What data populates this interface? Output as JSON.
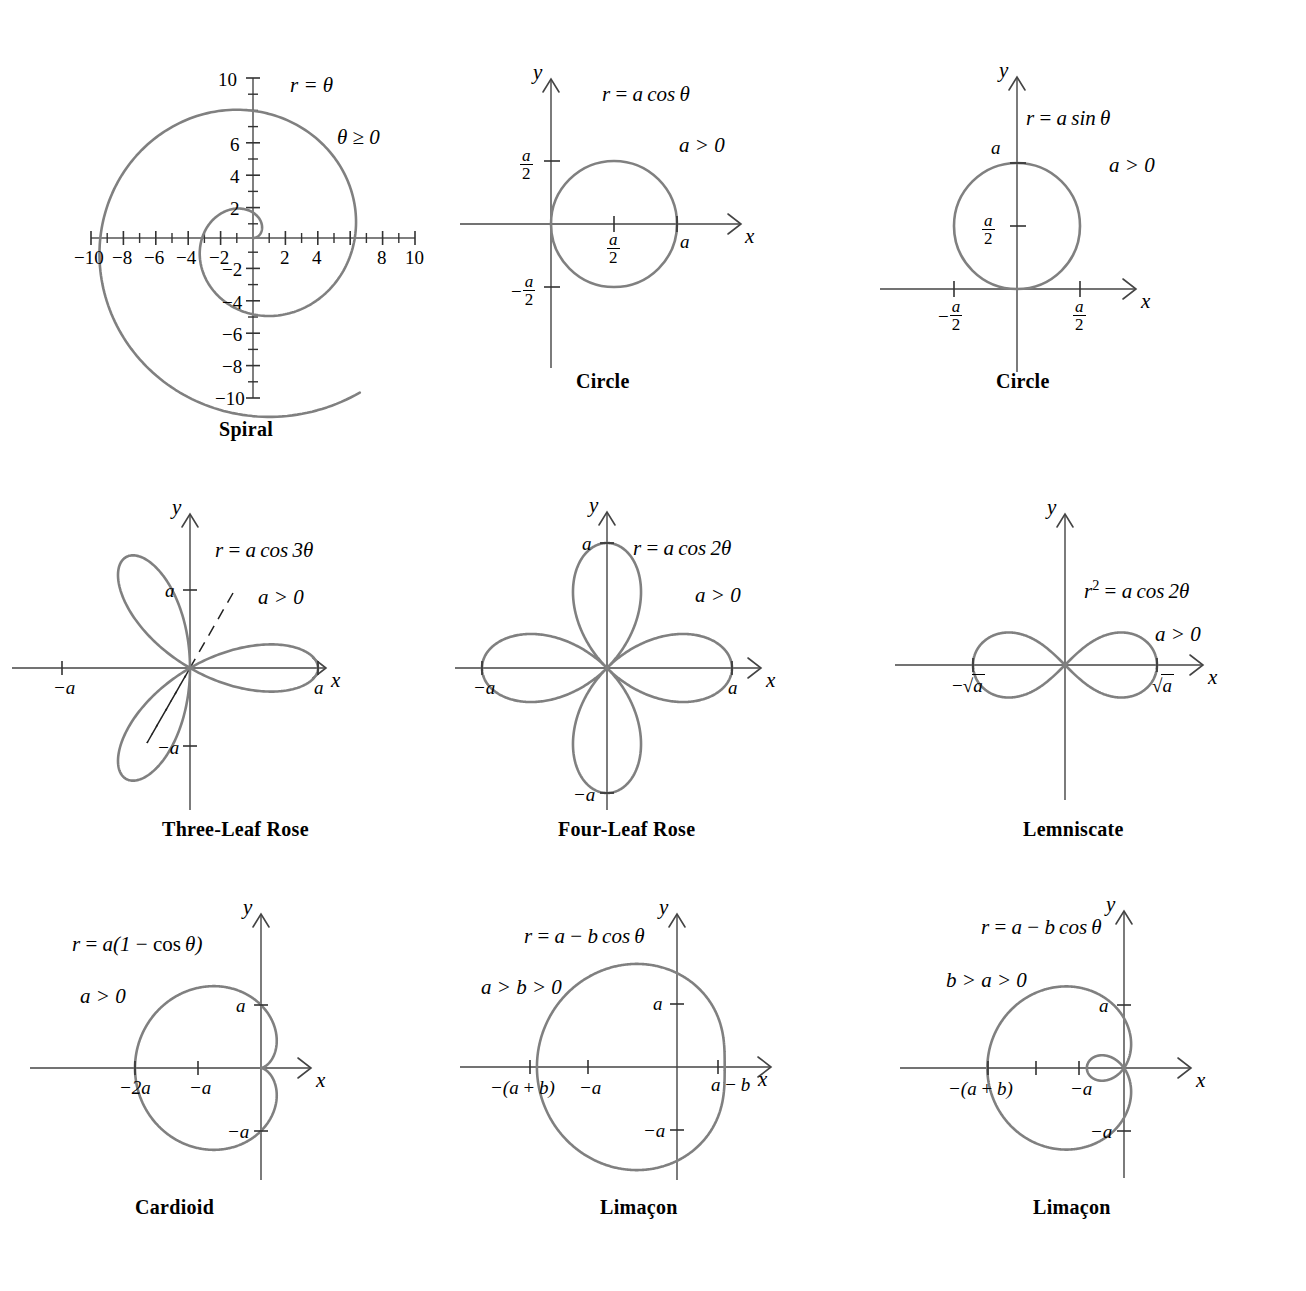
{
  "figure": {
    "kind": "polar-curve-reference-sheet",
    "curve_color": "#808080",
    "axis_color": "#555555",
    "text_color": "#000000",
    "background": "#ffffff"
  },
  "panels": [
    {
      "id": "spiral",
      "caption": "Spiral",
      "equation": "r = θ",
      "condition": "θ ≥ 0",
      "axis_x_label": "",
      "axis_y_label": "",
      "x_tick_labels": [
        "−10",
        "−8",
        "−6",
        "−4",
        "−2",
        "2",
        "4",
        "6",
        "8",
        "10"
      ],
      "y_tick_labels": [
        "10",
        "6",
        "4",
        "2",
        "−2",
        "−4",
        "−6",
        "−8",
        "−10"
      ],
      "axis_range_x": [
        -10,
        10
      ],
      "axis_range_y": [
        -10,
        10
      ],
      "tick_step": 1,
      "labeled_tick_step": 2
    },
    {
      "id": "circle-cos",
      "caption": "Circle",
      "equation": "r = a cos θ",
      "condition": "a > 0",
      "axis_x_label": "x",
      "axis_y_label": "y",
      "marks": [
        "a/2 (top)",
        "−a/2 (bottom)",
        "a/2 (center on x)",
        "a (right)"
      ]
    },
    {
      "id": "circle-sin",
      "caption": "Circle",
      "equation": "r = a sin θ",
      "condition": "a > 0",
      "axis_x_label": "x",
      "axis_y_label": "y",
      "marks": [
        "a (top)",
        "a/2 (on y)",
        "−a/2 (left on x)",
        "a/2 (right on x)"
      ]
    },
    {
      "id": "three-leaf-rose",
      "caption": "Three-Leaf Rose",
      "equation": "r = a cos 3θ",
      "condition": "a > 0",
      "axis_x_label": "x",
      "axis_y_label": "y",
      "marks": [
        "a (on y)",
        "−a (on y)",
        "−a (on x)",
        "a (on x)"
      ],
      "petal_axes_deg": [
        0,
        120,
        240
      ],
      "dashed_guides": true
    },
    {
      "id": "four-leaf-rose",
      "caption": "Four-Leaf Rose",
      "equation": "r = a cos 2θ",
      "condition": "a > 0",
      "axis_x_label": "x",
      "axis_y_label": "y",
      "marks": [
        "a (on y)",
        "−a (on y)",
        "−a (on x)",
        "a (on x)"
      ],
      "petal_axes_deg": [
        0,
        90,
        180,
        270
      ]
    },
    {
      "id": "lemniscate",
      "caption": "Lemniscate",
      "equation": "r² = a cos 2θ",
      "condition": "a > 0",
      "axis_x_label": "x",
      "axis_y_label": "y",
      "marks": [
        "−√a (left on x)",
        "√a (right on x)"
      ]
    },
    {
      "id": "cardioid",
      "caption": "Cardioid",
      "equation": "r = a(1 − cos θ)",
      "condition": "a > 0",
      "axis_x_label": "x",
      "axis_y_label": "y",
      "marks": [
        "a (on y)",
        "−a (on y)",
        "−2a (on x)",
        "−a (on x)"
      ]
    },
    {
      "id": "limacon-a-gt-b",
      "caption": "Limaçon",
      "equation": "r = a − b cos θ",
      "condition": "a > b > 0",
      "axis_x_label": "x",
      "axis_y_label": "y",
      "marks": [
        "a (on y)",
        "−a (on y)",
        "−(a + b) (on x)",
        "−a (on x)",
        "a − b (on x)"
      ]
    },
    {
      "id": "limacon-b-gt-a",
      "caption": "Limaçon",
      "equation": "r = a − b cos θ",
      "condition": "b > a > 0",
      "axis_x_label": "x",
      "axis_y_label": "y",
      "marks": [
        "a (on y)",
        "−a (on y)",
        "−(a + b) (on x)",
        "−a (on x)"
      ],
      "inner_loop": true
    }
  ],
  "chart_data": [
    {
      "type": "line",
      "id": "spiral",
      "title": "Spiral",
      "polar_equation": "r = theta",
      "domain_theta": [
        0,
        10
      ],
      "xlabel": "",
      "ylabel": "",
      "xlim": [
        -10,
        10
      ],
      "ylim": [
        -10,
        10
      ],
      "xticks": [
        -10,
        -9,
        -8,
        -7,
        -6,
        -5,
        -4,
        -3,
        -2,
        -1,
        1,
        2,
        3,
        4,
        5,
        6,
        7,
        8,
        9,
        10
      ],
      "xticklabels": [
        "-10",
        "",
        "-8",
        "",
        "-6",
        "",
        "-4",
        "",
        "-2",
        "",
        "",
        "2",
        "",
        "4",
        "",
        "",
        "",
        "8",
        "",
        "10"
      ],
      "yticks": [
        -10,
        -9,
        -8,
        -7,
        -6,
        -5,
        -4,
        -3,
        -2,
        -1,
        1,
        2,
        3,
        4,
        5,
        6,
        7,
        8,
        9,
        10
      ],
      "yticklabels": [
        "-10",
        "",
        "-8",
        "",
        "-6",
        "",
        "-4",
        "",
        "-2",
        "",
        "",
        "2",
        "",
        "4",
        "",
        "6",
        "",
        "",
        "",
        "10"
      ],
      "grid": false,
      "annotations": [
        "r = θ",
        "θ ≥ 0"
      ]
    },
    {
      "type": "line",
      "id": "circle-cos",
      "title": "Circle",
      "polar_equation": "r = a*cos(theta)",
      "annotations": [
        "r = a cos θ",
        "a > 0"
      ],
      "axis_intercepts": {
        "x": [
          "0",
          "a"
        ],
        "y": [
          "a/2",
          "-a/2"
        ]
      },
      "center": "a/2 on x-axis",
      "radius": "a/2",
      "xlabel": "x",
      "ylabel": "y",
      "grid": false
    },
    {
      "type": "line",
      "id": "circle-sin",
      "title": "Circle",
      "polar_equation": "r = a*sin(theta)",
      "annotations": [
        "r = a sin θ",
        "a > 0"
      ],
      "axis_intercepts": {
        "y": [
          "0",
          "a"
        ],
        "x": [
          "-a/2",
          "a/2"
        ]
      },
      "center": "a/2 on y-axis",
      "radius": "a/2",
      "xlabel": "x",
      "ylabel": "y",
      "grid": false
    },
    {
      "type": "line",
      "id": "three-leaf-rose",
      "title": "Three-Leaf Rose",
      "polar_equation": "r = a*cos(3*theta)",
      "annotations": [
        "r = a cos 3θ",
        "a > 0"
      ],
      "petal_tips_deg": [
        0,
        120,
        240
      ],
      "petal_length": "a",
      "xticklabels": [
        "-a",
        "a"
      ],
      "yticklabels": [
        "a",
        "-a"
      ],
      "xlabel": "x",
      "ylabel": "y",
      "grid": false
    },
    {
      "type": "line",
      "id": "four-leaf-rose",
      "title": "Four-Leaf Rose",
      "polar_equation": "r = a*cos(2*theta)",
      "annotations": [
        "r = a cos 2θ",
        "a > 0"
      ],
      "petal_tips_deg": [
        0,
        90,
        180,
        270
      ],
      "petal_length": "a",
      "xticklabels": [
        "-a",
        "a"
      ],
      "yticklabels": [
        "a",
        "-a"
      ],
      "xlabel": "x",
      "ylabel": "y",
      "grid": false
    },
    {
      "type": "line",
      "id": "lemniscate",
      "title": "Lemniscate",
      "polar_equation": "r^2 = a*cos(2*theta)",
      "annotations": [
        "r² = a cos 2θ",
        "a > 0"
      ],
      "xticklabels": [
        "-√a",
        "√a"
      ],
      "xlabel": "x",
      "ylabel": "y",
      "grid": false
    },
    {
      "type": "line",
      "id": "cardioid",
      "title": "Cardioid",
      "polar_equation": "r = a*(1 - cos(theta))",
      "annotations": [
        "r = a(1 − cos θ)",
        "a > 0"
      ],
      "xticklabels": [
        "-2a",
        "-a"
      ],
      "yticklabels": [
        "a",
        "-a"
      ],
      "xlabel": "x",
      "ylabel": "y",
      "grid": false
    },
    {
      "type": "line",
      "id": "limacon-a-gt-b",
      "title": "Limaçon",
      "polar_equation": "r = a - b*cos(theta)",
      "annotations": [
        "r = a − b cos θ",
        "a > b > 0"
      ],
      "xticklabels": [
        "-(a + b)",
        "-a",
        "a - b"
      ],
      "yticklabels": [
        "a",
        "-a"
      ],
      "xlabel": "x",
      "ylabel": "y",
      "grid": false
    },
    {
      "type": "line",
      "id": "limacon-b-gt-a",
      "title": "Limaçon",
      "polar_equation": "r = a - b*cos(theta)",
      "annotations": [
        "r = a − b cos θ",
        "b > a > 0"
      ],
      "xticklabels": [
        "-(a + b)",
        "-a"
      ],
      "yticklabels": [
        "a",
        "-a"
      ],
      "inner_loop": true,
      "xlabel": "x",
      "ylabel": "y",
      "grid": false
    }
  ]
}
